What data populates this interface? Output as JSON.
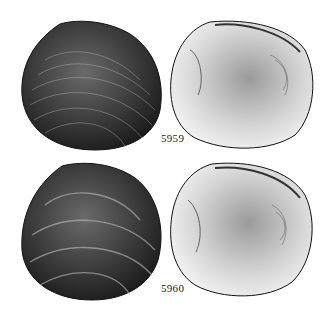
{
  "plate": {
    "figures": [
      {
        "id": "5959",
        "label": "5959",
        "views": [
          "exterior",
          "interior"
        ]
      },
      {
        "id": "5960",
        "label": "5960",
        "views": [
          "exterior",
          "interior"
        ]
      }
    ]
  }
}
